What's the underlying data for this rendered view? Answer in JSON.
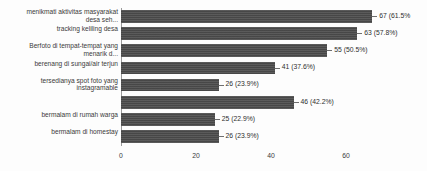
{
  "chart_data": {
    "type": "bar",
    "orientation": "horizontal",
    "title": "",
    "xlabel": "",
    "ylabel": "",
    "xlim": [
      0,
      70
    ],
    "grid": false,
    "legend": null,
    "bar_color": "#4b4b4b",
    "xticks": [
      "0",
      "20",
      "40",
      "60"
    ],
    "xtick_values": [
      0,
      20,
      40,
      60
    ],
    "categories": [
      "menikmati aktivitas masyarakat\ndesa seh...",
      "tracking keliling desa",
      "Berfoto di tempat-tempat yang\nmenarik d...",
      "berenang di sungai/air terjun",
      "tersedianya spot foto yang\ninstagramable",
      "",
      "bermalam di rumah warga",
      "bermalam di homestay"
    ],
    "values": [
      67,
      63,
      55,
      41,
      26,
      46,
      25,
      26
    ],
    "percents": [
      "61.5%",
      "57.8%",
      "50.5%",
      "37.6%",
      "23.9%",
      "42.2%",
      "22.9%",
      "23.9%"
    ],
    "data_labels": [
      "67 (61.5%",
      "63 (57.8%)",
      "55 (50.5%)",
      "41 (37.6%)",
      "26 (23.9%)",
      "46 (42.2%)",
      "25 (22.9%)",
      "26 (23.9%)"
    ]
  }
}
